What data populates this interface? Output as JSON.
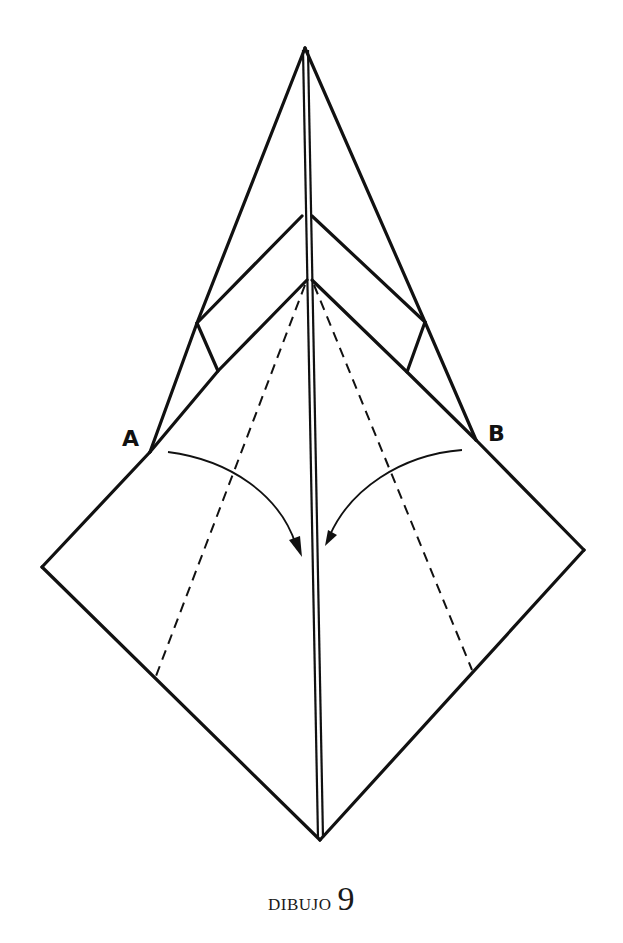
{
  "figure": {
    "caption_word": "DIBUJO",
    "caption_number": "9",
    "labels": {
      "a": "A",
      "b": "B"
    },
    "line_color": "#111111",
    "background": "#ffffff"
  }
}
